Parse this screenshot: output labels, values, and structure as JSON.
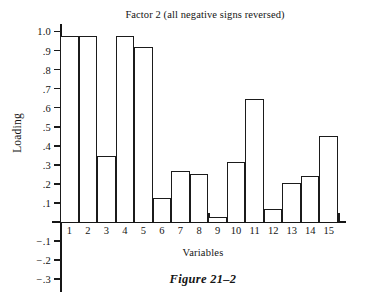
{
  "chart_data": {
    "type": "bar",
    "title": "Factor 2 (all negative signs reversed)",
    "xlabel": "Variables",
    "ylabel": "Loading",
    "categories": [
      "1",
      "2",
      "3",
      "4",
      "5",
      "6",
      "7",
      "8",
      "9",
      "10",
      "11",
      "12",
      "13",
      "14",
      "15"
    ],
    "values": [
      0.975,
      0.975,
      0.345,
      0.975,
      0.92,
      0.125,
      0.27,
      0.25,
      0.025,
      0.315,
      0.645,
      0.07,
      0.205,
      0.24,
      0.45
    ],
    "ylim": [
      -0.3,
      1.0
    ],
    "ytick_values": [
      1.0,
      0.9,
      0.8,
      0.7,
      0.6,
      0.5,
      0.4,
      0.3,
      0.2,
      0.1,
      -0.1,
      -0.2,
      -0.3
    ],
    "ytick_labels": [
      "1.0",
      ".9",
      ".8",
      ".7",
      ".6",
      ".5",
      ".4",
      ".3",
      ".2",
      ".1",
      "−.1",
      "−.2",
      "−.3"
    ],
    "grid": false,
    "legend": null,
    "bar_fill_color": "#ffffff",
    "bar_edge_color": "#1b1b1b",
    "axis_color": "#161616"
  },
  "caption": {
    "figure_label": "Figure 21–2"
  }
}
